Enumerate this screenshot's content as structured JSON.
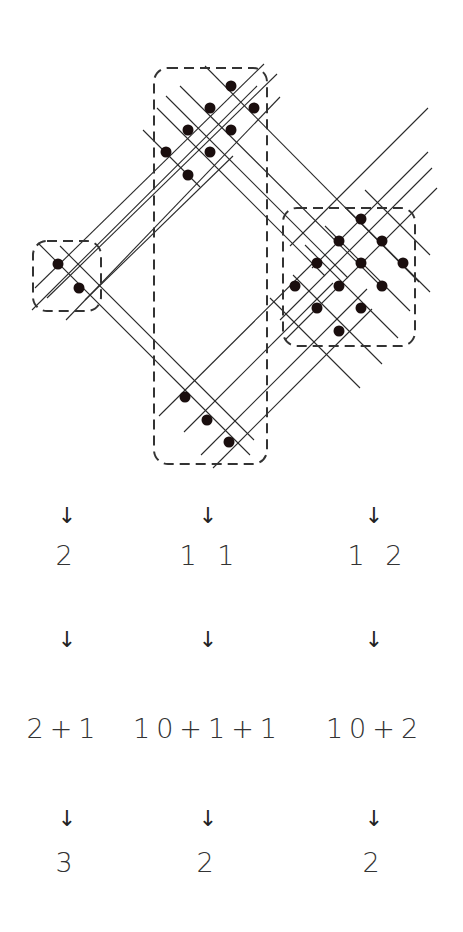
{
  "diagram": {
    "groups": [
      {
        "name": "left",
        "box": [
          33,
          241,
          101,
          311
        ],
        "dots": [
          [
            58,
            264
          ],
          [
            79,
            288
          ]
        ]
      },
      {
        "name": "middle",
        "box": [
          154,
          68,
          267,
          464
        ],
        "dots": [
          [
            231,
            86
          ],
          [
            210,
            108
          ],
          [
            254,
            108
          ],
          [
            188,
            130
          ],
          [
            231,
            130
          ],
          [
            166,
            152
          ],
          [
            210,
            152
          ],
          [
            188,
            175
          ],
          [
            185,
            397
          ],
          [
            207,
            420
          ],
          [
            229,
            442
          ]
        ]
      },
      {
        "name": "right",
        "box": [
          283,
          208,
          415,
          346
        ],
        "dots": [
          [
            361,
            219
          ],
          [
            339,
            241
          ],
          [
            382,
            241
          ],
          [
            317,
            263
          ],
          [
            361,
            263
          ],
          [
            403,
            263
          ],
          [
            295,
            286
          ],
          [
            339,
            286
          ],
          [
            382,
            286
          ],
          [
            317,
            308
          ],
          [
            361,
            308
          ],
          [
            339,
            331
          ]
        ]
      }
    ],
    "lines": [
      [
        35,
        288,
        264,
        64
      ],
      [
        47,
        298,
        277,
        74
      ],
      [
        32,
        310,
        257,
        86
      ],
      [
        66,
        320,
        280,
        97
      ],
      [
        85,
        300,
        233,
        156
      ],
      [
        143,
        130,
        200,
        187
      ],
      [
        157,
        108,
        325,
        276
      ],
      [
        166,
        96,
        348,
        278
      ],
      [
        180,
        86,
        385,
        290
      ],
      [
        205,
        66,
        419,
        282
      ],
      [
        60,
        246,
        254,
        440
      ],
      [
        38,
        243,
        250,
        455
      ],
      [
        159,
        416,
        318,
        258
      ],
      [
        184,
        432,
        333,
        283
      ],
      [
        201,
        455,
        367,
        289
      ],
      [
        213,
        468,
        372,
        309
      ],
      [
        290,
        246,
        428,
        108
      ],
      [
        312,
        268,
        428,
        152
      ],
      [
        280,
        320,
        432,
        168
      ],
      [
        285,
        340,
        437,
        188
      ],
      [
        270,
        298,
        360,
        388
      ],
      [
        293,
        275,
        382,
        364
      ],
      [
        305,
        245,
        398,
        338
      ],
      [
        325,
        226,
        410,
        311
      ],
      [
        345,
        207,
        430,
        292
      ],
      [
        365,
        190,
        430,
        255
      ]
    ]
  },
  "rows": {
    "arrows1": [
      "↓",
      "↓",
      "↓"
    ],
    "counts": [
      "2",
      "1 1",
      "1 2"
    ],
    "arrows2": [
      "↓",
      "↓",
      "↓"
    ],
    "sums": [
      "2+1",
      "10+1+1",
      "10+2"
    ],
    "arrows3": [
      "↓",
      "↓",
      "↓"
    ],
    "results": [
      "3",
      "2",
      "2"
    ]
  },
  "columns_x": [
    67,
    208,
    374
  ],
  "colors": {
    "ink": "#1a1a1a",
    "dot": "#1a0e0e",
    "dash": "#333333"
  }
}
